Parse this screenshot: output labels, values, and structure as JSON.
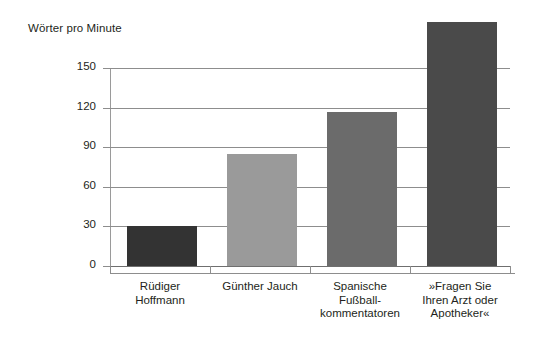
{
  "chart_data": {
    "type": "bar",
    "title": "Wörter pro Minute",
    "xlabel": "",
    "ylabel": "Wörter pro Minute",
    "ylim": [
      0,
      150
    ],
    "grid": true,
    "legend": "none",
    "yticks": [
      "0",
      "30",
      "60",
      "90",
      "120",
      "150"
    ],
    "ytick_values": [
      0,
      30,
      60,
      90,
      120,
      150
    ],
    "categories": [
      "Rüdiger Hoffmann",
      "Günther Jauch",
      "Spanische Fußballkommentatoren",
      "»Fragen Sie Ihren Arzt oder Apotheker«"
    ],
    "category_lines": [
      [
        "Rüdiger",
        "Hoffmann"
      ],
      [
        "Günther Jauch"
      ],
      [
        "Spanische",
        "Fußball-",
        "kommentatoren"
      ],
      [
        "»Fragen Sie",
        "Ihren Arzt oder",
        "Apotheker«"
      ]
    ],
    "values": [
      30,
      85,
      117,
      185
    ],
    "bar_colors": [
      "#333333",
      "#9a9a9a",
      "#6b6b6b",
      "#4a4a4a"
    ]
  },
  "colors": {
    "background": "#ffffff",
    "text": "#231f20",
    "gridline": "#8d8d8d",
    "axis": "#9a9a9a"
  }
}
